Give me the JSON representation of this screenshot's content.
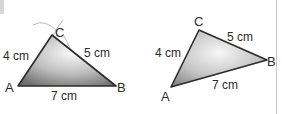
{
  "figure": {
    "triangle_left": {
      "vertices": {
        "A": "A",
        "B": "B",
        "C": "C"
      },
      "sides": {
        "AC": "4 cm",
        "CB": "5 cm",
        "AB": "7 cm"
      },
      "construction_arcs": true
    },
    "triangle_right": {
      "vertices": {
        "A": "A",
        "B": "B",
        "C": "C"
      },
      "sides": {
        "AC": "4 cm",
        "CB": "5 cm",
        "AB": "7 cm"
      }
    }
  },
  "colors": {
    "stroke": "#2b2b2b",
    "fill_dark": "#7a7a7a",
    "fill_light": "#f2f2f2",
    "arc": "#b8b8b8"
  }
}
